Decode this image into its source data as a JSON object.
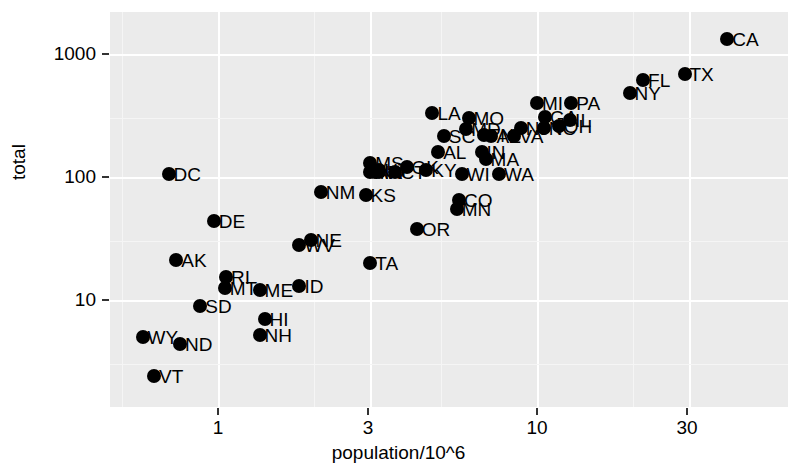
{
  "chart_data": {
    "type": "scatter",
    "title": "",
    "xlabel": "population/10^6",
    "ylabel": "total",
    "xscale": "log",
    "yscale": "log",
    "xlim": [
      0.45,
      42
    ],
    "ylim": [
      1.8,
      2100
    ],
    "xticks": [
      1,
      3,
      10,
      30
    ],
    "xticklabels": [
      "1",
      "3",
      "10",
      "30"
    ],
    "yticks": [
      10,
      100,
      1000
    ],
    "yticklabels": [
      "10",
      "100",
      "1000"
    ],
    "grid": true,
    "legend": "none",
    "point_label_key": "state abbreviation",
    "points": [
      {
        "label": "CA",
        "x": 39.5,
        "y": 1320
      },
      {
        "label": "TX",
        "x": 29.0,
        "y": 690
      },
      {
        "label": "FL",
        "x": 21.5,
        "y": 620
      },
      {
        "label": "NY",
        "x": 19.5,
        "y": 480
      },
      {
        "label": "PA",
        "x": 12.8,
        "y": 400
      },
      {
        "label": "IL",
        "x": 12.7,
        "y": 290
      },
      {
        "label": "OH",
        "x": 11.7,
        "y": 260
      },
      {
        "label": "MI",
        "x": 10.0,
        "y": 400
      },
      {
        "label": "GA",
        "x": 10.6,
        "y": 310
      },
      {
        "label": "NC",
        "x": 10.5,
        "y": 250
      },
      {
        "label": "NJ",
        "x": 8.9,
        "y": 250
      },
      {
        "label": "VA",
        "x": 8.5,
        "y": 215
      },
      {
        "label": "WA",
        "x": 7.6,
        "y": 105
      },
      {
        "label": "MA",
        "x": 6.9,
        "y": 140
      },
      {
        "label": "IN",
        "x": 6.7,
        "y": 160
      },
      {
        "label": "AZ",
        "x": 7.2,
        "y": 215
      },
      {
        "label": "TN",
        "x": 6.8,
        "y": 220
      },
      {
        "label": "MO",
        "x": 6.1,
        "y": 300
      },
      {
        "label": "MD",
        "x": 6.0,
        "y": 245
      },
      {
        "label": "WI",
        "x": 5.8,
        "y": 105
      },
      {
        "label": "MN",
        "x": 5.6,
        "y": 55
      },
      {
        "label": "CO",
        "x": 5.7,
        "y": 65
      },
      {
        "label": "SC",
        "x": 5.1,
        "y": 215
      },
      {
        "label": "LA",
        "x": 4.7,
        "y": 330
      },
      {
        "label": "AL",
        "x": 4.9,
        "y": 160
      },
      {
        "label": "KY",
        "x": 4.5,
        "y": 115
      },
      {
        "label": "OR",
        "x": 4.2,
        "y": 38
      },
      {
        "label": "OK",
        "x": 3.9,
        "y": 120
      },
      {
        "label": "CT",
        "x": 3.6,
        "y": 110
      },
      {
        "label": "IA",
        "x": 3.2,
        "y": 110
      },
      {
        "label": "UT",
        "x": 3.2,
        "y": 115
      },
      {
        "label": "MS",
        "x": 3.0,
        "y": 130
      },
      {
        "label": "AR",
        "x": 3.0,
        "y": 110
      },
      {
        "label": "NV",
        "x": 3.1,
        "y": 110
      },
      {
        "label": "KS",
        "x": 2.9,
        "y": 72
      },
      {
        "label": "TA",
        "x": 3.0,
        "y": 20
      },
      {
        "label": "NM",
        "x": 2.1,
        "y": 75
      },
      {
        "label": "NE",
        "x": 1.95,
        "y": 31
      },
      {
        "label": "WV",
        "x": 1.8,
        "y": 28
      },
      {
        "label": "ID",
        "x": 1.8,
        "y": 13
      },
      {
        "label": "ME",
        "x": 1.35,
        "y": 12
      },
      {
        "label": "NH",
        "x": 1.35,
        "y": 5.2
      },
      {
        "label": "HI",
        "x": 1.4,
        "y": 7.0
      },
      {
        "label": "RI",
        "x": 1.06,
        "y": 15.5
      },
      {
        "label": "MT",
        "x": 1.05,
        "y": 12.5
      },
      {
        "label": "SD",
        "x": 0.88,
        "y": 9.0
      },
      {
        "label": "DE",
        "x": 0.97,
        "y": 44
      },
      {
        "label": "AK",
        "x": 0.74,
        "y": 21
      },
      {
        "label": "ND",
        "x": 0.76,
        "y": 4.4
      },
      {
        "label": "WY",
        "x": 0.58,
        "y": 5.0
      },
      {
        "label": "VT",
        "x": 0.63,
        "y": 2.4
      },
      {
        "label": "DC",
        "x": 0.7,
        "y": 105
      }
    ]
  },
  "axes": {
    "y_label": "total",
    "x_label": "population/10^6",
    "y_ticks": [
      {
        "value": 1000,
        "label": "1000",
        "px": 54
      },
      {
        "value": 100,
        "label": "100",
        "px": 177
      },
      {
        "value": 10,
        "label": "10",
        "px": 300
      }
    ],
    "x_ticks": [
      {
        "value": 1,
        "label": "1",
        "px": 218
      },
      {
        "value": 3,
        "label": "3",
        "px": 368
      },
      {
        "value": 10,
        "label": "10",
        "px": 537
      },
      {
        "value": 30,
        "label": "30",
        "px": 687
      }
    ]
  },
  "style": {
    "panel_bg": "#ebebeb",
    "gridline_major": "#ffffff",
    "gridline_minor": "#f5f5f5",
    "point_color": "#000000",
    "text_color": "#000000",
    "page_bg": "#ffffff"
  }
}
